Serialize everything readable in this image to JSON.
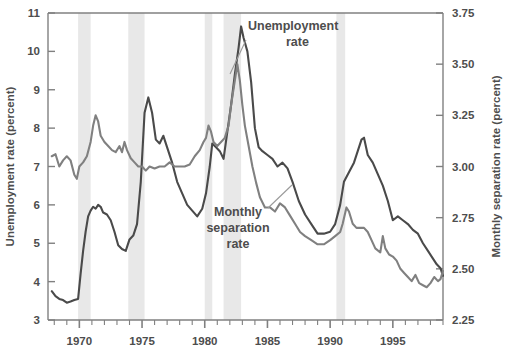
{
  "chart_data": {
    "type": "line",
    "title": "",
    "xlabel": "",
    "ylabel": "Unemployment rate (percent)",
    "ylabel_right": "Monthly separation rate (percent)",
    "grid": false,
    "legend_position": "inline-annotation",
    "xlim": [
      1967.5,
      1999.0
    ],
    "ylim": [
      3,
      11
    ],
    "ylim_right": [
      2.25,
      3.75
    ],
    "xticks": [
      1970,
      1975,
      1980,
      1985,
      1990,
      1995
    ],
    "xtick_labels": [
      "1970",
      "1975",
      "1980",
      "1985",
      "1990",
      "1995"
    ],
    "xminor_tick_interval": 1,
    "yticks": [
      3,
      4,
      5,
      6,
      7,
      8,
      9,
      10,
      11
    ],
    "ytick_labels": [
      "3",
      "4",
      "5",
      "6",
      "7",
      "8",
      "9",
      "10",
      "11"
    ],
    "yticks_right": [
      2.25,
      2.5,
      2.75,
      3.0,
      3.25,
      3.5,
      3.75
    ],
    "ytick_labels_right": [
      "2.25",
      "2.50",
      "2.75",
      "3.00",
      "3.25",
      "3.50",
      "3.75"
    ],
    "shaded_regions_label": "recession bands",
    "shaded_regions": [
      {
        "start": 1969.9,
        "end": 1970.9
      },
      {
        "start": 1973.9,
        "end": 1975.2
      },
      {
        "start": 1980.0,
        "end": 1980.6
      },
      {
        "start": 1981.5,
        "end": 1982.9
      },
      {
        "start": 1990.5,
        "end": 1991.2
      }
    ],
    "series": [
      {
        "name": "Unemployment rate",
        "axis": "left",
        "color": "#4a4a4a",
        "label_text": "Unemployment\nrate",
        "points": [
          [
            1967.8,
            3.75
          ],
          [
            1968.1,
            3.62
          ],
          [
            1968.4,
            3.55
          ],
          [
            1968.7,
            3.52
          ],
          [
            1969.0,
            3.45
          ],
          [
            1969.3,
            3.48
          ],
          [
            1969.6,
            3.52
          ],
          [
            1969.9,
            3.55
          ],
          [
            1970.1,
            4.2
          ],
          [
            1970.3,
            4.8
          ],
          [
            1970.5,
            5.3
          ],
          [
            1970.7,
            5.7
          ],
          [
            1970.9,
            5.85
          ],
          [
            1971.1,
            5.95
          ],
          [
            1971.3,
            5.9
          ],
          [
            1971.5,
            6.0
          ],
          [
            1971.7,
            5.95
          ],
          [
            1971.9,
            5.8
          ],
          [
            1972.2,
            5.75
          ],
          [
            1972.5,
            5.6
          ],
          [
            1972.8,
            5.3
          ],
          [
            1973.1,
            4.95
          ],
          [
            1973.4,
            4.85
          ],
          [
            1973.7,
            4.8
          ],
          [
            1974.0,
            5.1
          ],
          [
            1974.3,
            5.2
          ],
          [
            1974.6,
            5.5
          ],
          [
            1974.9,
            6.6
          ],
          [
            1975.2,
            8.4
          ],
          [
            1975.5,
            8.8
          ],
          [
            1975.8,
            8.4
          ],
          [
            1976.1,
            7.7
          ],
          [
            1976.4,
            7.6
          ],
          [
            1976.7,
            7.8
          ],
          [
            1977.0,
            7.5
          ],
          [
            1977.4,
            7.1
          ],
          [
            1977.8,
            6.6
          ],
          [
            1978.2,
            6.3
          ],
          [
            1978.6,
            6.0
          ],
          [
            1979.0,
            5.85
          ],
          [
            1979.4,
            5.7
          ],
          [
            1979.8,
            5.9
          ],
          [
            1980.1,
            6.3
          ],
          [
            1980.4,
            7.0
          ],
          [
            1980.6,
            7.6
          ],
          [
            1980.9,
            7.5
          ],
          [
            1981.2,
            7.4
          ],
          [
            1981.5,
            7.2
          ],
          [
            1981.8,
            7.9
          ],
          [
            1982.1,
            8.6
          ],
          [
            1982.4,
            9.4
          ],
          [
            1982.7,
            10.1
          ],
          [
            1982.9,
            10.65
          ],
          [
            1983.1,
            10.35
          ],
          [
            1983.4,
            10.0
          ],
          [
            1983.7,
            9.2
          ],
          [
            1984.0,
            8.0
          ],
          [
            1984.3,
            7.5
          ],
          [
            1984.6,
            7.4
          ],
          [
            1985.0,
            7.3
          ],
          [
            1985.4,
            7.2
          ],
          [
            1985.8,
            7.0
          ],
          [
            1986.2,
            7.1
          ],
          [
            1986.6,
            6.95
          ],
          [
            1987.0,
            6.6
          ],
          [
            1987.5,
            6.1
          ],
          [
            1988.0,
            5.75
          ],
          [
            1988.5,
            5.5
          ],
          [
            1989.0,
            5.25
          ],
          [
            1989.5,
            5.25
          ],
          [
            1990.0,
            5.3
          ],
          [
            1990.4,
            5.5
          ],
          [
            1990.8,
            6.0
          ],
          [
            1991.1,
            6.6
          ],
          [
            1991.5,
            6.85
          ],
          [
            1991.9,
            7.1
          ],
          [
            1992.2,
            7.4
          ],
          [
            1992.5,
            7.7
          ],
          [
            1992.7,
            7.75
          ],
          [
            1993.0,
            7.3
          ],
          [
            1993.4,
            7.1
          ],
          [
            1993.8,
            6.8
          ],
          [
            1994.2,
            6.5
          ],
          [
            1994.6,
            6.1
          ],
          [
            1995.0,
            5.6
          ],
          [
            1995.4,
            5.7
          ],
          [
            1995.8,
            5.6
          ],
          [
            1996.2,
            5.5
          ],
          [
            1996.6,
            5.35
          ],
          [
            1997.0,
            5.25
          ],
          [
            1997.4,
            5.0
          ],
          [
            1997.8,
            4.8
          ],
          [
            1998.2,
            4.6
          ],
          [
            1998.5,
            4.45
          ],
          [
            1998.8,
            4.35
          ],
          [
            1999.0,
            4.15
          ]
        ]
      },
      {
        "name": "Monthly separation rate",
        "axis": "right",
        "color": "#808080",
        "label_text": "Monthly\nseparation\nrate",
        "points": [
          [
            1967.8,
            3.05
          ],
          [
            1968.1,
            3.06
          ],
          [
            1968.4,
            3.0
          ],
          [
            1968.7,
            3.03
          ],
          [
            1969.0,
            3.05
          ],
          [
            1969.3,
            3.03
          ],
          [
            1969.6,
            2.96
          ],
          [
            1969.8,
            2.94
          ],
          [
            1970.0,
            3.0
          ],
          [
            1970.3,
            3.02
          ],
          [
            1970.6,
            3.05
          ],
          [
            1970.9,
            3.12
          ],
          [
            1971.1,
            3.2
          ],
          [
            1971.3,
            3.25
          ],
          [
            1971.5,
            3.22
          ],
          [
            1971.7,
            3.15
          ],
          [
            1972.0,
            3.12
          ],
          [
            1972.3,
            3.1
          ],
          [
            1972.6,
            3.08
          ],
          [
            1972.9,
            3.07
          ],
          [
            1973.2,
            3.1
          ],
          [
            1973.4,
            3.07
          ],
          [
            1973.6,
            3.12
          ],
          [
            1973.8,
            3.08
          ],
          [
            1974.1,
            3.04
          ],
          [
            1974.4,
            3.02
          ],
          [
            1974.7,
            3.0
          ],
          [
            1975.0,
            3.0
          ],
          [
            1975.3,
            2.98
          ],
          [
            1975.6,
            3.0
          ],
          [
            1976.0,
            2.99
          ],
          [
            1976.4,
            3.0
          ],
          [
            1976.8,
            3.0
          ],
          [
            1977.2,
            3.02
          ],
          [
            1977.6,
            3.0
          ],
          [
            1978.0,
            3.0
          ],
          [
            1978.4,
            3.0
          ],
          [
            1978.8,
            3.01
          ],
          [
            1979.2,
            3.05
          ],
          [
            1979.6,
            3.08
          ],
          [
            1979.9,
            3.12
          ],
          [
            1980.1,
            3.14
          ],
          [
            1980.3,
            3.2
          ],
          [
            1980.5,
            3.17
          ],
          [
            1980.7,
            3.12
          ],
          [
            1981.0,
            3.1
          ],
          [
            1981.3,
            3.12
          ],
          [
            1981.6,
            3.14
          ],
          [
            1981.9,
            3.2
          ],
          [
            1982.1,
            3.3
          ],
          [
            1982.4,
            3.42
          ],
          [
            1982.6,
            3.5
          ],
          [
            1982.8,
            3.42
          ],
          [
            1983.0,
            3.3
          ],
          [
            1983.2,
            3.2
          ],
          [
            1983.5,
            3.1
          ],
          [
            1983.8,
            3.0
          ],
          [
            1984.1,
            2.92
          ],
          [
            1984.4,
            2.85
          ],
          [
            1984.8,
            2.8
          ],
          [
            1985.2,
            2.8
          ],
          [
            1985.6,
            2.78
          ],
          [
            1986.0,
            2.82
          ],
          [
            1986.4,
            2.8
          ],
          [
            1986.8,
            2.76
          ],
          [
            1987.2,
            2.72
          ],
          [
            1987.6,
            2.68
          ],
          [
            1988.0,
            2.66
          ],
          [
            1988.5,
            2.64
          ],
          [
            1989.0,
            2.62
          ],
          [
            1989.5,
            2.62
          ],
          [
            1990.0,
            2.64
          ],
          [
            1990.4,
            2.66
          ],
          [
            1990.8,
            2.68
          ],
          [
            1991.0,
            2.72
          ],
          [
            1991.3,
            2.8
          ],
          [
            1991.5,
            2.78
          ],
          [
            1991.8,
            2.72
          ],
          [
            1992.1,
            2.7
          ],
          [
            1992.4,
            2.7
          ],
          [
            1992.7,
            2.7
          ],
          [
            1993.0,
            2.68
          ],
          [
            1993.3,
            2.64
          ],
          [
            1993.6,
            2.6
          ],
          [
            1994.0,
            2.58
          ],
          [
            1994.2,
            2.66
          ],
          [
            1994.4,
            2.6
          ],
          [
            1994.7,
            2.57
          ],
          [
            1995.0,
            2.56
          ],
          [
            1995.3,
            2.54
          ],
          [
            1995.6,
            2.5
          ],
          [
            1995.9,
            2.48
          ],
          [
            1996.2,
            2.46
          ],
          [
            1996.5,
            2.44
          ],
          [
            1996.8,
            2.47
          ],
          [
            1997.1,
            2.43
          ],
          [
            1997.4,
            2.42
          ],
          [
            1997.7,
            2.41
          ],
          [
            1998.0,
            2.43
          ],
          [
            1998.3,
            2.46
          ],
          [
            1998.6,
            2.44
          ],
          [
            1998.8,
            2.45
          ],
          [
            1999.0,
            2.49
          ]
        ]
      }
    ]
  },
  "annotations": {
    "unemployment": {
      "line1": "Unemployment",
      "line2": "rate"
    },
    "separation": {
      "line1": "Monthly",
      "line2": "separation",
      "line3": "rate"
    }
  },
  "colors": {
    "unemployment_line": "#4a4a4a",
    "separation_line": "#808080",
    "recession_band": "#e8e8e8",
    "axis": "#808080",
    "text": "#4d4d4d",
    "background": "#ffffff"
  }
}
